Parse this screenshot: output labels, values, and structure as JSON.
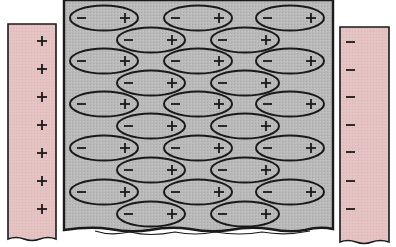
{
  "diagram": {
    "colors": {
      "plate_fill": "#e5c3c3",
      "plate_border": "#1a1a1a",
      "dielectric_fill": "#b9b9b9",
      "dielectric_border": "#1a1a1a",
      "molecule_fill": "#bdbdbd",
      "molecule_stroke": "#1a1a1a",
      "background": "#ffffff"
    },
    "left_plate": {
      "charge_sign": "+",
      "charge_count": 7
    },
    "right_plate": {
      "charge_sign": "−",
      "charge_count": 7
    },
    "dielectric": {
      "molecule_negative_label": "−",
      "molecule_positive_label": "+",
      "molecule_rows": 10,
      "molecules_per_row_pattern": [
        3,
        2
      ]
    }
  }
}
